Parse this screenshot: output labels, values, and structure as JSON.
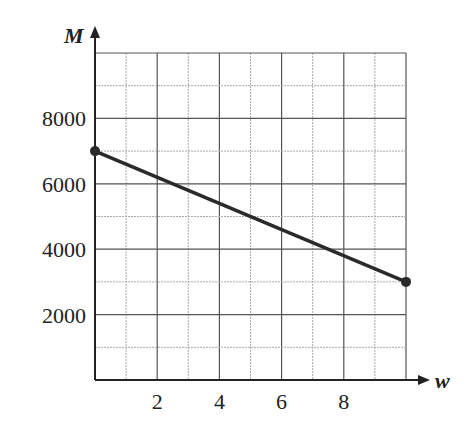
{
  "chart_data": {
    "type": "line",
    "title": "",
    "xlabel": "w",
    "ylabel": "M",
    "xlim": [
      0,
      10
    ],
    "ylim": [
      0,
      10000
    ],
    "x_ticks": [
      2,
      4,
      6,
      8
    ],
    "x_tick_labels": [
      "2",
      "4",
      "6",
      "8"
    ],
    "y_ticks": [
      2000,
      4000,
      6000,
      8000
    ],
    "y_tick_labels": [
      "2000",
      "4000",
      "6000",
      "8000"
    ],
    "grid": true,
    "minor_grid": true,
    "legend": null,
    "series": [
      {
        "name": "M(w)",
        "x": [
          0,
          10
        ],
        "y": [
          7000,
          3000
        ],
        "endpoints": "filled-dots",
        "color": "#2a2a2a"
      }
    ]
  }
}
